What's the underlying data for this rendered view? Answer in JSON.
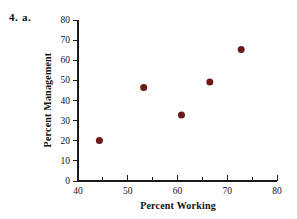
{
  "problem": {
    "number": "4.",
    "part": "a."
  },
  "chart_data": {
    "type": "scatter",
    "title": "",
    "xlabel": "Percent Working",
    "ylabel": "Percent Management",
    "xlim": [
      40,
      80
    ],
    "ylim": [
      0,
      80
    ],
    "xticks": [
      40,
      50,
      60,
      70,
      80
    ],
    "xminorticks": [
      45,
      55,
      65,
      75
    ],
    "yticks": [
      0,
      10,
      20,
      30,
      40,
      50,
      60,
      70,
      80
    ],
    "xtick_labels": [
      "40",
      "50",
      "60",
      "70",
      "80"
    ],
    "ytick_labels": [
      "0",
      "10",
      "20",
      "30",
      "40",
      "50",
      "60",
      "70",
      "80"
    ],
    "grid": false,
    "legend": "none",
    "marker": {
      "shape": "circle",
      "color": "#6B1A1A",
      "size": 7
    },
    "series": [
      {
        "name": "Percent Management vs Percent Working",
        "points": [
          {
            "x": 44.3,
            "y": 20.1
          },
          {
            "x": 53.2,
            "y": 46.5
          },
          {
            "x": 60.8,
            "y": 32.8
          },
          {
            "x": 66.5,
            "y": 49.2
          },
          {
            "x": 72.8,
            "y": 65.3
          }
        ]
      }
    ],
    "colors": {
      "axis": "#1a1a1a",
      "marker": "#6B1A1A",
      "background": "#ffffff",
      "text": "#111111"
    }
  }
}
